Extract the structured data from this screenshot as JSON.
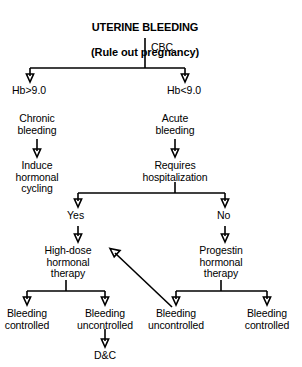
{
  "title": {
    "line1": "UTERINE BLEEDING",
    "line2": "(Rule out pregnancy)"
  },
  "labels": {
    "cbc": "CBC",
    "hb_high": "Hb>9.0",
    "hb_low": "Hb<9.0",
    "yes": "Yes",
    "no": "No"
  },
  "nodes": {
    "chronic_bleeding": "Chronic\nbleeding",
    "acute_bleeding": "Acute\nbleeding",
    "induce_hormonal_cycling": "Induce\nhormonal\ncycling",
    "requires_hospitalization": "Requires\nhospitalization",
    "high_dose_hormonal_therapy": "High-dose\nhormonal\ntherapy",
    "progestin_hormonal_therapy": "Progestin\nhormonal\ntherapy",
    "bleeding_controlled_left": "Bleeding\ncontrolled",
    "bleeding_uncontrolled_left": "Bleeding\nuncontrolled",
    "bleeding_uncontrolled_right": "Bleeding\nuncontrolled",
    "bleeding_controlled_right": "Bleeding\ncontrolled",
    "dc": "D&C"
  },
  "colors": {
    "ink": "#000000",
    "paper": "#ffffff"
  }
}
